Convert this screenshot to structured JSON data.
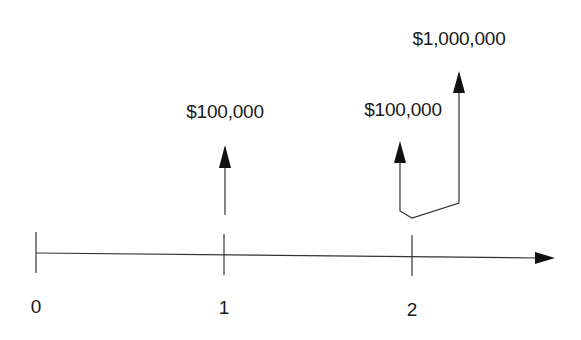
{
  "diagram": {
    "type": "cash-flow-timeline",
    "axis": {
      "ticks": [
        {
          "label": "0",
          "x": 36
        },
        {
          "label": "1",
          "x": 224
        },
        {
          "label": "2",
          "x": 412
        }
      ]
    },
    "cash_flows": [
      {
        "time": "1",
        "amount_label": "$100,000"
      },
      {
        "time": "2",
        "amount_label": "$100,000"
      },
      {
        "time": "2",
        "amount_label": "$1,000,000"
      }
    ],
    "colors": {
      "line": "#333333",
      "text": "#1a1a1a",
      "background": "#ffffff"
    }
  }
}
